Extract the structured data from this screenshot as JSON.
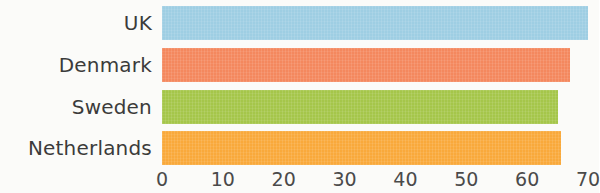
{
  "chart_data": {
    "type": "bar",
    "orientation": "horizontal",
    "title": "",
    "subtitle": "",
    "xlabel": "",
    "ylabel": "",
    "categories": [
      "UK",
      "Denmark",
      "Sweden",
      "Netherlands"
    ],
    "values": [
      70,
      67,
      65,
      65.5
    ],
    "series": [
      {
        "name": "",
        "values": [
          70,
          67,
          65,
          65.5
        ]
      }
    ],
    "bar_colors": [
      "#9ECEE3",
      "#F4885E",
      "#A5C64A",
      "#F9A93B"
    ],
    "xlim": [
      0,
      70
    ],
    "ylim": null,
    "x_ticks": [
      0,
      10,
      20,
      30,
      40,
      50,
      60,
      70
    ],
    "x_tick_labels": [
      "0",
      "10",
      "20",
      "30",
      "40",
      "50",
      "60",
      "70"
    ],
    "grid": false,
    "legend": false,
    "legend_position": "none",
    "annotations": []
  },
  "style": {
    "background": "#fbfbf9",
    "label_color": "#3b3b3b",
    "tick_color": "#4a4a4a"
  }
}
